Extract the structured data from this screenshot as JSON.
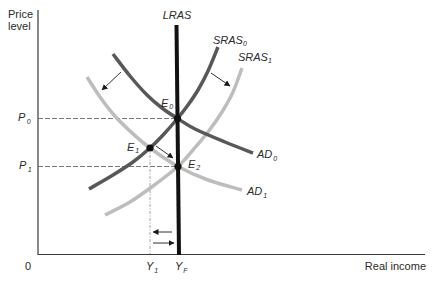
{
  "figure": {
    "y_axis_label": [
      "Price",
      "level"
    ],
    "x_axis_label": "Real income",
    "origin_label": "0"
  },
  "colors": {
    "lras": "#111111",
    "dark": "#585858",
    "light": "#bdbdbd",
    "axis": "#3a3a3a",
    "text": "#2a2a2a"
  },
  "diagram": {
    "curves": [
      {
        "id": "lras",
        "label": "LRAS",
        "subscript": "",
        "style": "lras",
        "width": 4,
        "points": [
          [
            176.5,
            25
          ],
          [
            179,
            255
          ]
        ]
      },
      {
        "id": "sras0",
        "label": "SRAS",
        "subscript": "0",
        "style": "dark",
        "width": 3.5,
        "points": [
          [
            89,
            189
          ],
          [
            113,
            175
          ],
          [
            133,
            162
          ],
          [
            150,
            148
          ],
          [
            164,
            134
          ],
          [
            177.5,
            118.5
          ],
          [
            188,
            105
          ],
          [
            198,
            90
          ],
          [
            208,
            71
          ],
          [
            218,
            47
          ]
        ]
      },
      {
        "id": "sras1",
        "label": "SRAS",
        "subscript": "1",
        "style": "light",
        "width": 3.5,
        "points": [
          [
            105,
            215
          ],
          [
            130,
            202
          ],
          [
            153,
            186
          ],
          [
            178,
            166.5
          ],
          [
            193,
            150
          ],
          [
            208,
            132
          ],
          [
            222,
            112
          ],
          [
            233,
            92
          ],
          [
            242,
            68
          ]
        ]
      },
      {
        "id": "ad0",
        "label": "AD",
        "subscript": "0",
        "style": "dark",
        "width": 3.5,
        "points": [
          [
            113,
            54
          ],
          [
            130,
            76
          ],
          [
            147,
            95
          ],
          [
            162,
            108
          ],
          [
            177.5,
            118.5
          ],
          [
            195,
            129
          ],
          [
            225,
            142
          ],
          [
            253,
            153
          ]
        ]
      },
      {
        "id": "ad1",
        "label": "AD",
        "subscript": "1",
        "style": "light",
        "width": 3.5,
        "points": [
          [
            87,
            77
          ],
          [
            100,
            97
          ],
          [
            114,
            115
          ],
          [
            131,
            132
          ],
          [
            150,
            148
          ],
          [
            178,
            166.5
          ],
          [
            208,
            180
          ],
          [
            242,
            190
          ]
        ]
      }
    ],
    "equilibria": [
      {
        "id": "e0",
        "label": "E",
        "subscript": "0",
        "x": 177.5,
        "y": 118.5
      },
      {
        "id": "e1",
        "label": "E",
        "subscript": "1",
        "x": 150,
        "y": 148
      },
      {
        "id": "e2",
        "label": "E",
        "subscript": "2",
        "x": 178,
        "y": 166.5
      }
    ],
    "price_levels": [
      {
        "id": "p0",
        "label": "P",
        "subscript": "0"
      },
      {
        "id": "p1",
        "label": "P",
        "subscript": "1"
      }
    ],
    "income_levels": [
      {
        "id": "y1",
        "label": "Y",
        "subscript": "1"
      },
      {
        "id": "yf",
        "label": "Y",
        "subscript": "F"
      }
    ],
    "guides": [
      {
        "id": "p0-line",
        "orientation": "h",
        "at": 118.5,
        "from": 38,
        "to": 177.5
      },
      {
        "id": "p1-line",
        "orientation": "h",
        "at": 166.5,
        "from": 38,
        "to": 178
      },
      {
        "id": "y1-line",
        "orientation": "v",
        "at": 150,
        "from": 148,
        "to": 254
      }
    ],
    "arrows": [
      {
        "id": "ad-shift",
        "from": [
          121,
          72
        ],
        "to": [
          102,
          90
        ]
      },
      {
        "id": "sras-shift",
        "from": [
          211,
          73
        ],
        "to": [
          230,
          86
        ]
      },
      {
        "id": "e1-to-e2",
        "from": [
          156,
          146
        ],
        "to": [
          173,
          158
        ]
      },
      {
        "id": "income-left",
        "from": [
          172,
          232
        ],
        "to": [
          153,
          232
        ]
      },
      {
        "id": "income-right",
        "from": [
          153,
          243
        ],
        "to": [
          174,
          243
        ]
      }
    ]
  }
}
